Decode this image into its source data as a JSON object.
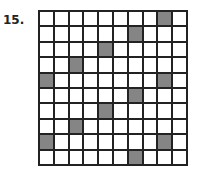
{
  "problem": {
    "number_label": "15."
  },
  "grid": {
    "rows": 10,
    "cols": 10,
    "fill_color": "#858585",
    "shaded": [
      [
        0,
        8
      ],
      [
        1,
        6
      ],
      [
        2,
        4
      ],
      [
        3,
        2
      ],
      [
        4,
        0
      ],
      [
        4,
        8
      ],
      [
        5,
        6
      ],
      [
        6,
        4
      ],
      [
        7,
        2
      ],
      [
        8,
        0
      ],
      [
        8,
        8
      ],
      [
        9,
        6
      ]
    ]
  }
}
